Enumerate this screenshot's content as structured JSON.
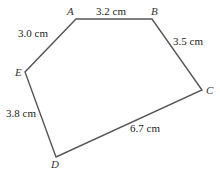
{
  "diagram": {
    "type": "pentagon",
    "stroke_color": "#555555",
    "vertices": [
      {
        "name": "A",
        "x": 76,
        "y": 19,
        "label_x": 67,
        "label_y": 15
      },
      {
        "name": "B",
        "x": 152,
        "y": 19,
        "label_x": 151,
        "label_y": 15
      },
      {
        "name": "C",
        "x": 202,
        "y": 90,
        "label_x": 206,
        "label_y": 94
      },
      {
        "name": "D",
        "x": 56,
        "y": 157,
        "label_x": 51,
        "label_y": 168
      },
      {
        "name": "E",
        "x": 25,
        "y": 72,
        "label_x": 15,
        "label_y": 76
      }
    ],
    "edges": [
      {
        "from": "A",
        "to": "B",
        "length": "3.2 cm",
        "label_x": 96,
        "label_y": 15
      },
      {
        "from": "B",
        "to": "C",
        "length": "3.5 cm",
        "label_x": 173,
        "label_y": 45
      },
      {
        "from": "C",
        "to": "D",
        "length": "6.7 cm",
        "label_x": 130,
        "label_y": 132
      },
      {
        "from": "D",
        "to": "E",
        "length": "3.8 cm",
        "label_x": 6,
        "label_y": 117
      },
      {
        "from": "E",
        "to": "A",
        "length": "3.0 cm",
        "label_x": 18,
        "label_y": 37
      }
    ]
  }
}
